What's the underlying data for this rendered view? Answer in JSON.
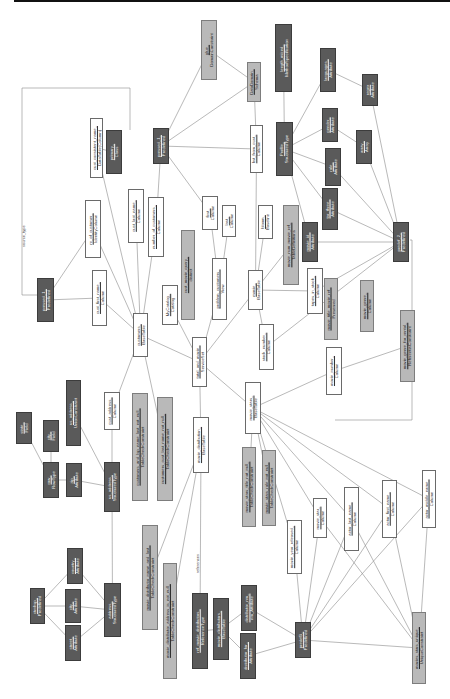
{
  "diagram": {
    "orientation": "rotated-90",
    "edge_labels": [
      {
        "text": "source_type",
        "x": 21,
        "y": 247
      },
      {
        "text": "references",
        "x": 195,
        "y": 573
      }
    ],
    "nodes": [
      {
        "id": "geo",
        "l1": "glue_",
        "l2": "DomainConstraint",
        "x": 201,
        "y": 20,
        "w": 16,
        "h": 60,
        "style": "gray"
      },
      {
        "id": "length",
        "l1": "length_mized_",
        "l2": "MethodSpecification",
        "x": 275,
        "y": 24,
        "w": 17,
        "h": 68,
        "style": "dark"
      },
      {
        "id": "languages",
        "l1": "languages_",
        "l2": "Attribute",
        "x": 320,
        "y": 48,
        "w": 16,
        "h": 44,
        "style": "dark"
      },
      {
        "id": "regex",
        "l1": "regex",
        "l2": "Attribute",
        "x": 362,
        "y": 74,
        "w": 16,
        "h": 32,
        "style": "dark"
      },
      {
        "id": "primaryclass",
        "l1": "primary_",
        "l2": "Class",
        "x": 106,
        "y": 130,
        "w": 16,
        "h": 44,
        "style": "dark"
      },
      {
        "id": "pressed1",
        "l1": "pressed_1_",
        "l2": "Predefined",
        "x": 153,
        "y": 128,
        "w": 16,
        "h": 36,
        "style": "dark"
      },
      {
        "id": "custconsent",
        "l1": "cust_consistent_name_",
        "l2": "DataTable(Column)",
        "x": 90,
        "y": 118,
        "w": 13,
        "h": 60,
        "style": "light"
      },
      {
        "id": "datadom",
        "l1": "DataDomain_",
        "l2": "Schema",
        "x": 247,
        "y": 62,
        "w": 14,
        "h": 40,
        "style": "gray"
      },
      {
        "id": "bstcol",
        "l1": "bst_from_cust_",
        "l2": "Column",
        "x": 250,
        "y": 125,
        "w": 13,
        "h": 48,
        "style": "light"
      },
      {
        "id": "profile",
        "l1": "Profile_",
        "l2": "StructuredType",
        "x": 276,
        "y": 122,
        "w": 17,
        "h": 54,
        "style": "dark"
      },
      {
        "id": "gender",
        "l1": "gender_",
        "l2": "Attribute",
        "x": 322,
        "y": 108,
        "w": 16,
        "h": 34,
        "style": "dark"
      },
      {
        "id": "array",
        "l1": "array_",
        "l2": "Array",
        "x": 356,
        "y": 130,
        "w": 16,
        "h": 34,
        "style": "dark"
      },
      {
        "id": "role",
        "l1": "role_",
        "l2": "Attribute",
        "x": 325,
        "y": 148,
        "w": 16,
        "h": 38,
        "style": "dark"
      },
      {
        "id": "nofcust",
        "l1": "nr_of_customer_",
        "l2": "IdentityColumn",
        "x": 85,
        "y": 200,
        "w": 16,
        "h": 58,
        "style": "light"
      },
      {
        "id": "custlast",
        "l1": "cust_last_name_",
        "l2": "Column",
        "x": 128,
        "y": 189,
        "w": 16,
        "h": 54,
        "style": "light"
      },
      {
        "id": "numberof",
        "l1": "number_of_customers_",
        "l2": "Column",
        "x": 148,
        "y": 197,
        "w": 16,
        "h": 60,
        "style": "light"
      },
      {
        "id": "first",
        "l1": "first_",
        "l2": "Column",
        "x": 202,
        "y": 196,
        "w": 16,
        "h": 34,
        "style": "light"
      },
      {
        "id": "last",
        "l1": "last_",
        "l2": "Column",
        "x": 222,
        "y": 205,
        "w": 14,
        "h": 32,
        "style": "light"
      },
      {
        "id": "tarthree",
        "l1": "tar_three_",
        "l2": "Attribute",
        "x": 322,
        "y": 188,
        "w": 16,
        "h": 42,
        "style": "dark"
      },
      {
        "id": "predef2",
        "l1": "predef_2_",
        "l2": "Predefined",
        "x": 393,
        "y": 222,
        "w": 16,
        "h": 40,
        "style": "dark"
      },
      {
        "id": "pressed1b",
        "l1": "pressed_1_",
        "l2": "Predefined",
        "x": 37,
        "y": 278,
        "w": 17,
        "h": 44,
        "style": "dark"
      },
      {
        "id": "custfirst",
        "l1": "cust_first_name_",
        "l2": "Column",
        "x": 92,
        "y": 270,
        "w": 15,
        "h": 56,
        "style": "light"
      },
      {
        "id": "customers",
        "l1": "customers_",
        "l2": "BaseTable",
        "x": 133,
        "y": 313,
        "w": 15,
        "h": 44,
        "style": "light"
      },
      {
        "id": "mycatalog",
        "l1": "MyCatalog_",
        "l2": "Catalog",
        "x": 162,
        "y": 285,
        "w": 16,
        "h": 40,
        "style": "light"
      },
      {
        "id": "custmovie",
        "l1": "cust_movie_query_",
        "l2": "distinct",
        "x": 181,
        "y": 230,
        "w": 14,
        "h": 90,
        "style": "gray"
      },
      {
        "id": "problem",
        "l1": "problem_customers_",
        "l2": "View",
        "x": 212,
        "y": 258,
        "w": 15,
        "h": 62,
        "style": "light"
      },
      {
        "id": "bloom",
        "l1": "bloom_",
        "l2": "Baseline",
        "x": 258,
        "y": 205,
        "w": 15,
        "h": 34,
        "style": "light"
      },
      {
        "id": "movienum",
        "l1": "movie_num_movie_ref_",
        "l2": "TableDefinitions",
        "x": 283,
        "y": 205,
        "w": 16,
        "h": 80,
        "style": "gray"
      },
      {
        "id": "movieid",
        "l1": "movie_id_",
        "l2": "Attribute",
        "x": 302,
        "y": 222,
        "w": 16,
        "h": 40,
        "style": "dark"
      },
      {
        "id": "mymovies",
        "l1": "movie_",
        "l2": "BaseTable",
        "x": 248,
        "y": 270,
        "w": 15,
        "h": 40,
        "style": "light"
      },
      {
        "id": "tapesinstock",
        "l1": "tapes_in_stock_",
        "l2": "Column",
        "x": 307,
        "y": 268,
        "w": 16,
        "h": 46,
        "style": "light"
      },
      {
        "id": "movietitle",
        "l1": "movie_title_movie_ref_",
        "l2": "Preserved",
        "x": 324,
        "y": 278,
        "w": 14,
        "h": 62,
        "style": "gray"
      },
      {
        "id": "moviedatadomain",
        "l1": "movie_genre_",
        "l2": "Column",
        "x": 360,
        "y": 280,
        "w": 14,
        "h": 52,
        "style": "gray"
      },
      {
        "id": "totalnum",
        "l1": "total_and_movie_",
        "l2": "ServiceSet",
        "x": 192,
        "y": 337,
        "w": 15,
        "h": 50,
        "style": "light"
      },
      {
        "id": "stocknumber",
        "l1": "stock_number_",
        "l2": "Column",
        "x": 259,
        "y": 324,
        "w": 15,
        "h": 46,
        "style": "light"
      },
      {
        "id": "moviedesc",
        "l1": "movie_genre_for_rental_",
        "l2": "ReferentialConstraint",
        "x": 400,
        "y": 310,
        "w": 15,
        "h": 72,
        "style": "gray"
      },
      {
        "id": "movienumber",
        "l1": "movie_number_",
        "l2": "Column",
        "x": 326,
        "y": 347,
        "w": 16,
        "h": 48,
        "style": "light"
      },
      {
        "id": "custcount",
        "l1": "cust_address_",
        "l2": "Column",
        "x": 104,
        "y": 392,
        "w": 16,
        "h": 38,
        "style": "light"
      },
      {
        "id": "usaddress",
        "l1": "us_address_",
        "l2": "UnionConstraint",
        "x": 66,
        "y": 380,
        "w": 15,
        "h": 66,
        "style": "dark"
      },
      {
        "id": "customersfk",
        "l1": "customers_and_lsp_name_last_not_null_",
        "l2": "TableCheckConstraint",
        "x": 132,
        "y": 393,
        "w": 16,
        "h": 108,
        "style": "gray"
      },
      {
        "id": "customersfk2",
        "l1": "customers_cust_last_name_not_null_",
        "l2": "TableCheckConstraint",
        "x": 157,
        "y": 397,
        "w": 16,
        "h": 104,
        "style": "gray"
      },
      {
        "id": "moviestars",
        "l1": "movie_stars_",
        "l2": "BaseTable",
        "x": 245,
        "y": 382,
        "w": 16,
        "h": 52,
        "style": "light"
      },
      {
        "id": "moviedist",
        "l1": "movie_distribution_",
        "l2": "BaseTable",
        "x": 193,
        "y": 417,
        "w": 16,
        "h": 56,
        "style": "light"
      },
      {
        "id": "statelevel",
        "l1": "state_",
        "l2": "Field",
        "x": 16,
        "y": 412,
        "w": 16,
        "h": 32,
        "style": "dark"
      },
      {
        "id": "citylevel",
        "l1": "city_",
        "l2": "Field",
        "x": 43,
        "y": 420,
        "w": 16,
        "h": 32,
        "style": "dark"
      },
      {
        "id": "row",
        "l1": "row_",
        "l2": "RowType",
        "x": 43,
        "y": 462,
        "w": 16,
        "h": 36,
        "style": "dark"
      },
      {
        "id": "zip",
        "l1": "zip_",
        "l2": "Attribute",
        "x": 66,
        "y": 463,
        "w": 16,
        "h": 34,
        "style": "dark"
      },
      {
        "id": "usaddrstruct",
        "l1": "us_address_",
        "l2": "StructuredType",
        "x": 104,
        "y": 462,
        "w": 16,
        "h": 50,
        "style": "dark"
      },
      {
        "id": "moviestarstitle",
        "l1": "movie_stars_title_not_null_",
        "l2": "TableCheckConstraint",
        "x": 242,
        "y": 447,
        "w": 14,
        "h": 80,
        "style": "gray"
      },
      {
        "id": "moviestarsrole",
        "l1": "movie_stars_role_not_null_",
        "l2": "TableCheckConstraint",
        "x": 262,
        "y": 450,
        "w": 14,
        "h": 76,
        "style": "gray"
      },
      {
        "id": "movieyear",
        "l1": "movie_year_released_",
        "l2": "Column",
        "x": 287,
        "y": 520,
        "w": 15,
        "h": 54,
        "style": "light"
      },
      {
        "id": "actorlast",
        "l1": "actor_last_name_",
        "l2": "Column",
        "x": 344,
        "y": 487,
        "w": 15,
        "h": 64,
        "style": "light"
      },
      {
        "id": "actorfirst",
        "l1": "actor_first_name_",
        "l2": "Column",
        "x": 382,
        "y": 480,
        "w": 15,
        "h": 58,
        "style": "light"
      },
      {
        "id": "actormiddle",
        "l1": "actor_middle_name_",
        "l2": "Column",
        "x": 422,
        "y": 470,
        "w": 14,
        "h": 58,
        "style": "light"
      },
      {
        "id": "moviestar",
        "l1": "movie_star_",
        "l2": "Column",
        "x": 313,
        "y": 498,
        "w": 14,
        "h": 40,
        "style": "light"
      },
      {
        "id": "modistdist",
        "l1": "movie_distributor_name_and_last_",
        "l2": "TableCheckConstraint",
        "x": 142,
        "y": 525,
        "w": 16,
        "h": 105,
        "style": "gray"
      },
      {
        "id": "modistadd",
        "l1": "movie_distributor_address_is_not_null_",
        "l2": "TableCheckConstraint",
        "x": 163,
        "y": 563,
        "w": 14,
        "h": 116,
        "style": "gray"
      },
      {
        "id": "refmovie",
        "l1": "ref_movie_distributors_",
        "l2": "ReferenceType",
        "x": 192,
        "y": 593,
        "w": 16,
        "h": 76,
        "style": "dark"
      },
      {
        "id": "moviedistrefs",
        "l1": "movie_distributors_",
        "l2": "BaseTable",
        "x": 213,
        "y": 598,
        "w": 16,
        "h": 62,
        "style": "dark"
      },
      {
        "id": "address",
        "l1": "address_",
        "l2": "StructuredType",
        "x": 104,
        "y": 583,
        "w": 17,
        "h": 54,
        "style": "dark"
      },
      {
        "id": "country",
        "l1": "country_",
        "l2": "Attribute",
        "x": 67,
        "y": 548,
        "w": 16,
        "h": 36,
        "style": "dark"
      },
      {
        "id": "city",
        "l1": "city_",
        "l2": "Attribute",
        "x": 65,
        "y": 589,
        "w": 16,
        "h": 34,
        "style": "dark"
      },
      {
        "id": "street",
        "l1": "street_",
        "l2": "Attribute",
        "x": 65,
        "y": 625,
        "w": 16,
        "h": 36,
        "style": "dark"
      },
      {
        "id": "ctrnhsp",
        "l1": "ctrnhsp_",
        "l2": "Predefined",
        "x": 30,
        "y": 588,
        "w": 15,
        "h": 36,
        "style": "dark"
      },
      {
        "id": "distributornm",
        "l1": "distributor_nm_",
        "l2": "nm_Attribute",
        "x": 241,
        "y": 585,
        "w": 16,
        "h": 46,
        "style": "dark"
      },
      {
        "id": "distributorfor",
        "l1": "distributor_for_",
        "l2": "Attribute",
        "x": 240,
        "y": 633,
        "w": 16,
        "h": 46,
        "style": "dark"
      },
      {
        "id": "predef3",
        "l1": "predef3_",
        "l2": "Predefined",
        "x": 295,
        "y": 622,
        "w": 16,
        "h": 36,
        "style": "dark"
      },
      {
        "id": "moviestarsunique",
        "l1": "movies_stars_unique_",
        "l2": "UniqueConstraint",
        "x": 412,
        "y": 612,
        "w": 14,
        "h": 72,
        "style": "gray"
      }
    ],
    "edges": [
      [
        "geo",
        "datadom"
      ],
      [
        "length",
        "profile"
      ],
      [
        "languages",
        "regex"
      ],
      [
        "languages",
        "profile"
      ],
      [
        "gender",
        "array"
      ],
      [
        "gender",
        "profile"
      ],
      [
        "array",
        "predef2"
      ],
      [
        "regex",
        "predef2"
      ],
      [
        "role",
        "profile"
      ],
      [
        "role",
        "predef2"
      ],
      [
        "tarthree",
        "profile"
      ],
      [
        "tarthree",
        "predef2"
      ],
      [
        "movieid",
        "profile"
      ],
      [
        "movieid",
        "predef2"
      ],
      [
        "datadom",
        "bstcol"
      ],
      [
        "datadom",
        "pressed1"
      ],
      [
        "geo",
        "pressed1"
      ],
      [
        "pressed1",
        "first"
      ],
      [
        "pressed1",
        "numberof"
      ],
      [
        "pressed1",
        "bstcol"
      ],
      [
        "primaryclass",
        "custconsent"
      ],
      [
        "custconsent",
        "customers"
      ],
      [
        "nofcust",
        "customers"
      ],
      [
        "nofcust",
        "pressed1b"
      ],
      [
        "custlast",
        "customers"
      ],
      [
        "numberof",
        "customers"
      ],
      [
        "custfirst",
        "customers"
      ],
      [
        "custfirst",
        "pressed1b"
      ],
      [
        "first",
        "problem"
      ],
      [
        "last",
        "problem"
      ],
      [
        "problem",
        "totalnum"
      ],
      [
        "bstcol",
        "mymovies"
      ],
      [
        "bloom",
        "mymovies"
      ],
      [
        "mymovies",
        "totalnum"
      ],
      [
        "mymovies",
        "stocknumber"
      ],
      [
        "tapesinstock",
        "mymovies"
      ],
      [
        "tapesinstock",
        "predef2"
      ],
      [
        "stocknumber",
        "predef2"
      ],
      [
        "movienum",
        "mymovies"
      ],
      [
        "mycatalog",
        "totalnum"
      ],
      [
        "customers",
        "totalnum"
      ],
      [
        "customers",
        "custcount"
      ],
      [
        "customers",
        "customersfk2"
      ],
      [
        "custcount",
        "usaddrstruct"
      ],
      [
        "usaddress",
        "usaddrstruct"
      ],
      [
        "totalnum",
        "moviedist"
      ],
      [
        "totalnum",
        "moviestars"
      ],
      [
        "moviestars",
        "movienumber"
      ],
      [
        "movienumber",
        "moviedesc"
      ],
      [
        "moviestars",
        "moviestarsrole"
      ],
      [
        "moviestars",
        "moviestarstitle"
      ],
      [
        "moviestars",
        "movieyear"
      ],
      [
        "moviestars",
        "moviestar"
      ],
      [
        "moviestars",
        "actorlast"
      ],
      [
        "moviestars",
        "actorfirst"
      ],
      [
        "moviestars",
        "actormiddle"
      ],
      [
        "moviedist",
        "modistdist"
      ],
      [
        "moviedist",
        "refmovie"
      ],
      [
        "moviedist",
        "modistadd"
      ],
      [
        "refmovie",
        "moviedistrefs"
      ],
      [
        "row",
        "statelevel"
      ],
      [
        "row",
        "citylevel"
      ],
      [
        "row",
        "zip"
      ],
      [
        "zip",
        "usaddrstruct"
      ],
      [
        "usaddrstruct",
        "address"
      ],
      [
        "address",
        "country"
      ],
      [
        "address",
        "city"
      ],
      [
        "address",
        "street"
      ],
      [
        "ctrnhsp",
        "country"
      ],
      [
        "ctrnhsp",
        "city"
      ],
      [
        "ctrnhsp",
        "street"
      ],
      [
        "moviedistrefs",
        "distributornm"
      ],
      [
        "moviedistrefs",
        "distributorfor"
      ],
      [
        "distributornm",
        "predef3"
      ],
      [
        "distributorfor",
        "predef3"
      ],
      [
        "movieyear",
        "predef3"
      ],
      [
        "moviestar",
        "predef3"
      ],
      [
        "actorlast",
        "predef3"
      ],
      [
        "actorfirst",
        "predef3"
      ],
      [
        "actormiddle",
        "predef3"
      ],
      [
        "moviestar",
        "moviestarsunique"
      ],
      [
        "actorlast",
        "moviestarsunique"
      ],
      [
        "actorfirst",
        "moviestarsunique"
      ],
      [
        "actormiddle",
        "moviestarsunique"
      ],
      [
        "moviestarsunique",
        "predef3"
      ]
    ],
    "polylines": [
      {
        "points": [
          [
            130,
            130
          ],
          [
            130,
            88
          ],
          [
            22,
            88
          ],
          [
            22,
            295
          ],
          [
            37,
            295
          ]
        ]
      },
      {
        "points": [
          [
            410,
            240
          ],
          [
            412,
            240
          ],
          [
            412,
            420
          ],
          [
            335,
            420
          ]
        ]
      }
    ]
  }
}
